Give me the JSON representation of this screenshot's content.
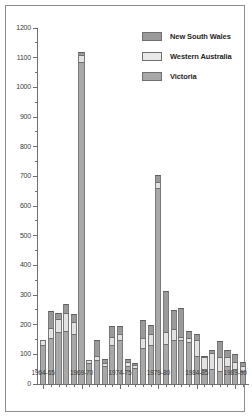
{
  "chart_data": {
    "type": "bar",
    "subtype": "stacked-vertical",
    "title": "",
    "subtitle": "",
    "xlabel": "",
    "ylabel": "",
    "ylim": [
      0,
      1200
    ],
    "ytick_step": 100,
    "yminor_step": 50,
    "grid": false,
    "legend_position": "top-right",
    "categories": [
      "1964-65",
      "1965-66",
      "1966-67",
      "1967-68",
      "1968-69",
      "1969-70",
      "1970-71",
      "1971-72",
      "1972-73",
      "1973-74",
      "1974-75",
      "1975-76",
      "1976-77",
      "1977-78",
      "1978-79",
      "1979-80",
      "1980-81",
      "1981-82",
      "1982-83",
      "1983-84",
      "1984-85",
      "1985-86",
      "1986-87",
      "1987-88",
      "1988-89",
      "1989-90",
      "1990-91"
    ],
    "ytick_labels": [
      "0",
      "100",
      "200",
      "300",
      "400",
      "500",
      "600",
      "700",
      "800",
      "900",
      "1000",
      "1100",
      "1200"
    ],
    "xtick_labels": [
      "1964-65",
      "1969-70",
      "1974-75",
      "1979-80",
      "1984-85",
      "1989-90"
    ],
    "xtick_label_indices": [
      0,
      5,
      10,
      15,
      20,
      25
    ],
    "series": [
      {
        "name": "Victoria",
        "color": "#a8a8a8",
        "values": [
          130,
          155,
          175,
          180,
          170,
          1085,
          70,
          80,
          60,
          130,
          150,
          60,
          55,
          120,
          130,
          660,
          135,
          150,
          150,
          140,
          95,
          50,
          50,
          45,
          60,
          50,
          45
        ]
      },
      {
        "name": "Western Australia",
        "color": "#e8e8e8",
        "values": [
          20,
          35,
          45,
          60,
          40,
          25,
          10,
          15,
          10,
          30,
          20,
          15,
          10,
          35,
          40,
          20,
          40,
          35,
          10,
          15,
          55,
          40,
          55,
          45,
          30,
          25,
          15
        ]
      },
      {
        "name": "New South Wales",
        "color": "#9a9a9a",
        "values": [
          0,
          55,
          20,
          30,
          25,
          10,
          0,
          55,
          15,
          35,
          25,
          10,
          5,
          60,
          30,
          25,
          140,
          65,
          95,
          25,
          20,
          5,
          10,
          55,
          25,
          25,
          15
        ]
      },
      {
        "name": "Total",
        "note": "stacked totals",
        "values": [
          150,
          245,
          240,
          270,
          235,
          1120,
          80,
          150,
          85,
          195,
          195,
          85,
          70,
          215,
          200,
          705,
          315,
          250,
          255,
          180,
          170,
          95,
          115,
          145,
          115,
          100,
          75
        ]
      }
    ]
  },
  "legend": {
    "entries": [
      {
        "label": "New South Wales",
        "swatch": "nsw"
      },
      {
        "label": "Western Australia",
        "swatch": "wa"
      },
      {
        "label": "Victoria",
        "swatch": "vic"
      }
    ]
  }
}
